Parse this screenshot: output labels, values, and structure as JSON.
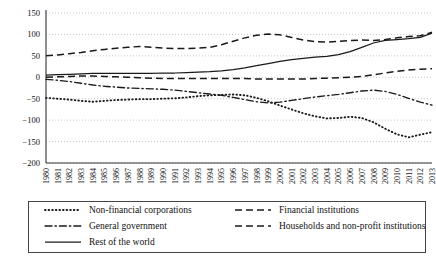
{
  "chart_data": {
    "type": "line",
    "title": "",
    "subtitle": "",
    "xlabel": "",
    "ylabel": "",
    "ylim": [
      -200,
      150
    ],
    "yticks": [
      150,
      100,
      50,
      0,
      -50,
      -100,
      -150,
      -200
    ],
    "ytick_labels": [
      "150",
      "100",
      "50",
      "0",
      "−50",
      "−100",
      "−150",
      "−200"
    ],
    "grid": true,
    "grid_style": "dotted-horizontal",
    "legend_position": "bottom",
    "x": [
      1980,
      1981,
      1982,
      1983,
      1984,
      1985,
      1986,
      1987,
      1988,
      1989,
      1990,
      1991,
      1992,
      1993,
      1994,
      1995,
      1996,
      1997,
      1998,
      1999,
      2000,
      2001,
      2002,
      2003,
      2004,
      2005,
      2006,
      2007,
      2008,
      2009,
      2010,
      2011,
      2012,
      2013
    ],
    "xtick_labels": [
      "1980",
      "1981",
      "1982",
      "1983",
      "1984",
      "1985",
      "1986",
      "1987",
      "1988",
      "1989",
      "1990",
      "1991",
      "1992",
      "1993",
      "1994",
      "1995",
      "1996",
      "1997",
      "1998",
      "1999",
      "2000",
      "2001",
      "2002",
      "2003",
      "2004",
      "2005",
      "2006",
      "2007",
      "2008",
      "2009",
      "2010",
      "2011",
      "2012",
      "2013"
    ],
    "series": [
      {
        "name": "Non-financial corporations",
        "style": "dotted",
        "values": [
          -48,
          -50,
          -52,
          -55,
          -57,
          -55,
          -53,
          -52,
          -51,
          -51,
          -50,
          -49,
          -47,
          -44,
          -42,
          -41,
          -40,
          -42,
          -48,
          -56,
          -66,
          -75,
          -84,
          -91,
          -96,
          -95,
          -92,
          -95,
          -105,
          -120,
          -133,
          -140,
          -134,
          -128
        ]
      },
      {
        "name": "General government",
        "style": "dash-dot",
        "values": [
          -5,
          -7,
          -10,
          -14,
          -18,
          -21,
          -23,
          -25,
          -26,
          -27,
          -28,
          -30,
          -33,
          -36,
          -39,
          -42,
          -47,
          -52,
          -57,
          -60,
          -58,
          -54,
          -50,
          -46,
          -43,
          -40,
          -36,
          -32,
          -30,
          -33,
          -40,
          -49,
          -58,
          -65
        ]
      },
      {
        "name": "Rest of the world",
        "style": "solid",
        "values": [
          5,
          6,
          7,
          8,
          9,
          9,
          9,
          9,
          9,
          9,
          10,
          10,
          11,
          12,
          13,
          15,
          18,
          22,
          27,
          32,
          37,
          41,
          44,
          47,
          49,
          53,
          60,
          70,
          80,
          86,
          88,
          90,
          93,
          103
        ]
      },
      {
        "name": "Financial institutions",
        "style": "dashed",
        "values": [
          50,
          52,
          55,
          58,
          62,
          65,
          68,
          70,
          72,
          70,
          68,
          67,
          67,
          68,
          70,
          76,
          84,
          92,
          98,
          101,
          99,
          93,
          87,
          83,
          82,
          84,
          86,
          87,
          86,
          88,
          92,
          95,
          97,
          105
        ]
      },
      {
        "name": "Households and non-profit institutions",
        "style": "dashed",
        "values": [
          0,
          1,
          2,
          3,
          3,
          2,
          1,
          0,
          -1,
          -2,
          -3,
          -3,
          -3,
          -3,
          -3,
          -3,
          -3,
          -3,
          -4,
          -4,
          -4,
          -4,
          -4,
          -3,
          -2,
          -1,
          0,
          2,
          6,
          10,
          14,
          17,
          19,
          20
        ]
      }
    ]
  },
  "legend": {
    "entries": [
      {
        "label": "Non-financial corporations",
        "style": "dotted",
        "column": 1,
        "row": 1
      },
      {
        "label": "Financial institutions",
        "style": "dashed",
        "column": 2,
        "row": 1
      },
      {
        "label": "General government",
        "style": "dash-dot",
        "column": 1,
        "row": 2
      },
      {
        "label": "Households and non-profit institutions",
        "style": "dashed",
        "column": 2,
        "row": 2
      },
      {
        "label": "Rest of the world",
        "style": "solid",
        "column": 1,
        "row": 3
      }
    ]
  },
  "colors": {
    "line": "#1a1a1a",
    "grid": "#bbbbbb",
    "axis": "#333333",
    "background": "#ffffff"
  }
}
